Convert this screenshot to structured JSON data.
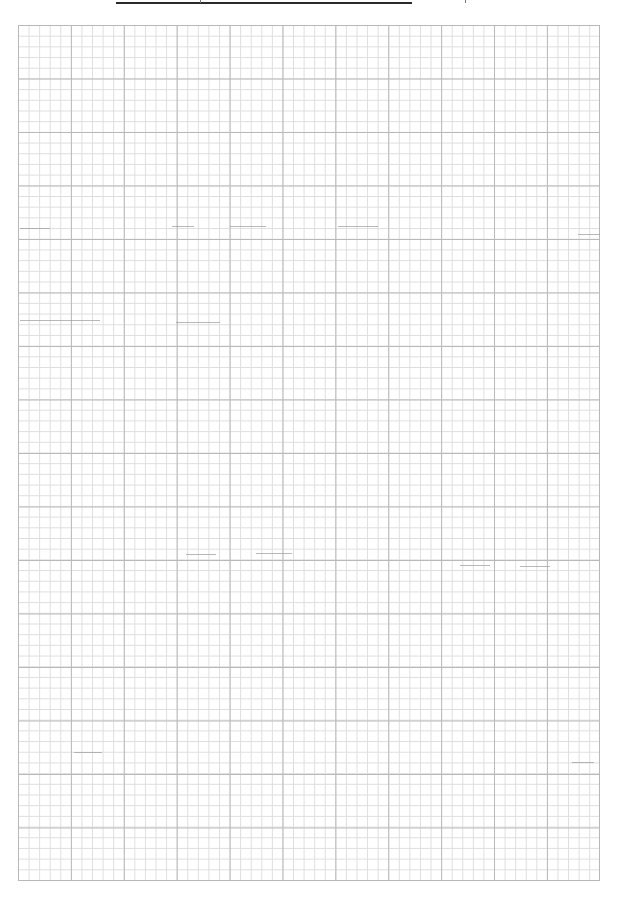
{
  "page": {
    "type": "graph-paper",
    "background_color": "#ffffff"
  },
  "title": {
    "text": "",
    "rule_color": "#2a2a2a"
  },
  "grid": {
    "major_columns": 11,
    "major_rows": 16,
    "minor_per_major": 5,
    "major_line_color": "#b9b9b9",
    "minor_line_color": "#dedede",
    "border_color": "#b8b8b8"
  },
  "marks": [
    {
      "x": 20,
      "y": 228,
      "w": 30
    },
    {
      "x": 172,
      "y": 226,
      "w": 22
    },
    {
      "x": 230,
      "y": 226,
      "w": 36
    },
    {
      "x": 338,
      "y": 226,
      "w": 40
    },
    {
      "x": 578,
      "y": 234,
      "w": 22
    },
    {
      "x": 20,
      "y": 320,
      "w": 80
    },
    {
      "x": 176,
      "y": 322,
      "w": 44
    },
    {
      "x": 186,
      "y": 554,
      "w": 30
    },
    {
      "x": 256,
      "y": 553,
      "w": 36
    },
    {
      "x": 460,
      "y": 565,
      "w": 30
    },
    {
      "x": 520,
      "y": 566,
      "w": 30
    },
    {
      "x": 74,
      "y": 752,
      "w": 28
    },
    {
      "x": 572,
      "y": 762,
      "w": 22
    }
  ]
}
